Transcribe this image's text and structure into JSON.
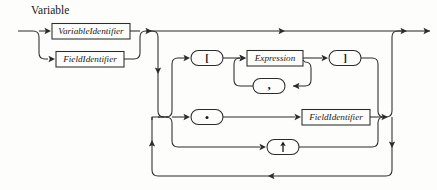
{
  "diagram": {
    "title": "Variable",
    "type": "railroad-syntax-diagram",
    "ink_color": "#2b2b2b",
    "paper_color": "#fdfdfb",
    "nodes": {
      "variable_identifier": {
        "label": "VariableIdentifier",
        "shape": "box",
        "kind": "nonterminal"
      },
      "field_identifier_left": {
        "label": "FieldIdentifier",
        "shape": "box",
        "kind": "nonterminal"
      },
      "left_bracket": {
        "label": "[",
        "shape": "oval",
        "kind": "terminal"
      },
      "expression": {
        "label": "Expression",
        "shape": "box",
        "kind": "nonterminal"
      },
      "right_bracket": {
        "label": "]",
        "shape": "oval",
        "kind": "terminal"
      },
      "comma": {
        "label": ",",
        "shape": "oval",
        "kind": "terminal"
      },
      "dot": {
        "label": ".",
        "shape": "oval",
        "kind": "terminal"
      },
      "field_identifier_right": {
        "label": "FieldIdentifier",
        "shape": "box",
        "kind": "nonterminal"
      },
      "up_arrow": {
        "label": "↑",
        "shape": "oval",
        "kind": "terminal"
      }
    }
  }
}
